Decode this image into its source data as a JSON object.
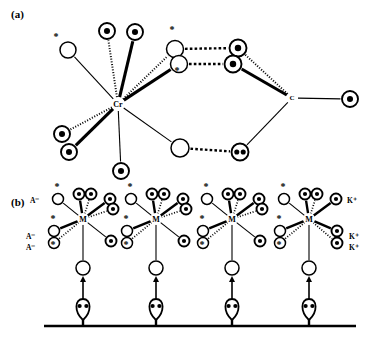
{
  "figure": {
    "panels": [
      {
        "id": "a",
        "label": "(a)",
        "label_x": 11,
        "label_y": 8
      },
      {
        "id": "b",
        "label": "(b)",
        "label_x": 11,
        "label_y": 196
      }
    ]
  },
  "panel_a": {
    "center_atom": {
      "label": "Cr",
      "x": 118,
      "y": 104,
      "font_size": 8
    },
    "bridge_atom": {
      "label": "C",
      "x": 292,
      "y": 98,
      "font_size": 7
    },
    "nodes": [
      {
        "name": "open-star-upper-left",
        "x": 68,
        "y": 50,
        "r": 8,
        "type": "open",
        "star": true,
        "star_dx": -12,
        "star_dy": -10
      },
      {
        "name": "dot-top-left",
        "x": 107,
        "y": 31,
        "r": 8,
        "type": "dot"
      },
      {
        "name": "dot-top-right",
        "x": 135,
        "y": 32,
        "r": 8,
        "type": "dot"
      },
      {
        "name": "dot-lower-left-upper",
        "x": 62,
        "y": 134,
        "r": 8,
        "type": "dot"
      },
      {
        "name": "dot-lower-left-lower",
        "x": 69,
        "y": 152,
        "r": 8,
        "type": "dot"
      },
      {
        "name": "dot-bottom-center",
        "x": 121,
        "y": 171,
        "r": 8,
        "type": "dot"
      },
      {
        "name": "open-bridge-upper",
        "x": 175,
        "y": 49,
        "r": 8.5,
        "type": "open",
        "star": true,
        "star_dx": -3,
        "star_dy": -16
      },
      {
        "name": "open-bridge-lower",
        "x": 179,
        "y": 64,
        "r": 8.5,
        "type": "open",
        "star": true,
        "star_dx": -2,
        "star_dy": 10
      },
      {
        "name": "dot-ring-upper-right",
        "x": 238,
        "y": 48,
        "r": 8.5,
        "type": "dot"
      },
      {
        "name": "dot-ring-lower-right",
        "x": 233,
        "y": 64,
        "r": 8.5,
        "type": "dot"
      },
      {
        "name": "open-bottom-middle",
        "x": 180,
        "y": 148,
        "r": 9,
        "type": "open"
      },
      {
        "name": "double-dot-bottom-right",
        "x": 240,
        "y": 152,
        "r": 8.5,
        "type": "doubledot"
      },
      {
        "name": "dot-far-right",
        "x": 350,
        "y": 99,
        "r": 8,
        "type": "dot"
      }
    ],
    "bonds": [
      {
        "from": [
          118,
          104
        ],
        "to": [
          68,
          50
        ],
        "style": "thin"
      },
      {
        "from": [
          118,
          104
        ],
        "to": [
          107,
          31
        ],
        "style": "dotted"
      },
      {
        "from": [
          118,
          104
        ],
        "to": [
          135,
          32
        ],
        "style": "bold"
      },
      {
        "from": [
          118,
          104
        ],
        "to": [
          62,
          134
        ],
        "style": "dotted"
      },
      {
        "from": [
          118,
          104
        ],
        "to": [
          69,
          152
        ],
        "style": "bold"
      },
      {
        "from": [
          118,
          104
        ],
        "to": [
          121,
          171
        ],
        "style": "thin"
      },
      {
        "from": [
          118,
          104
        ],
        "to": [
          175,
          49
        ],
        "style": "dotted"
      },
      {
        "from": [
          118,
          104
        ],
        "to": [
          179,
          64
        ],
        "style": "bold"
      },
      {
        "from": [
          118,
          104
        ],
        "to": [
          180,
          148
        ],
        "style": "thin"
      },
      {
        "from": [
          175,
          49
        ],
        "to": [
          238,
          48
        ],
        "style": "dashed-h"
      },
      {
        "from": [
          179,
          64
        ],
        "to": [
          233,
          64
        ],
        "style": "dashed-h"
      },
      {
        "from": [
          180,
          148
        ],
        "to": [
          240,
          152
        ],
        "style": "dashed-h"
      },
      {
        "from": [
          238,
          48
        ],
        "to": [
          292,
          98
        ],
        "style": "dotted"
      },
      {
        "from": [
          233,
          64
        ],
        "to": [
          292,
          98
        ],
        "style": "bold"
      },
      {
        "from": [
          240,
          152
        ],
        "to": [
          292,
          98
        ],
        "style": "thin"
      },
      {
        "from": [
          292,
          98
        ],
        "to": [
          350,
          99
        ],
        "style": "thin"
      }
    ]
  },
  "panel_b": {
    "baseline": {
      "x1": 44,
      "x2": 356,
      "y": 326
    },
    "clusters": [
      {
        "name": "cluster-1",
        "center": {
          "label": "M",
          "x": 83,
          "y": 219,
          "font_size": 8
        },
        "anchor": {
          "x": 83,
          "y": 268,
          "r": 7
        },
        "head": {
          "x": 83,
          "y": 310
        },
        "arrow": {
          "x": 83,
          "y_from": 300,
          "y_to": 277
        },
        "ions": [
          {
            "text": "A⁻",
            "x": 30,
            "y": 196
          },
          {
            "text": "A⁻",
            "x": 26,
            "y": 232
          },
          {
            "text": "A⁻",
            "x": 26,
            "y": 243
          }
        ],
        "nodes": [
          {
            "name": "open-star-upper-left",
            "x": 58,
            "y": 199,
            "r": 5.5,
            "type": "open",
            "star": true,
            "star_dx": -1,
            "star_dy": -9,
            "bond": "thin"
          },
          {
            "name": "dot-top-a",
            "x": 79,
            "y": 194,
            "r": 5.5,
            "type": "dot",
            "bond": "bold"
          },
          {
            "name": "dot-top-b",
            "x": 91,
            "y": 194,
            "r": 5.5,
            "type": "dot",
            "bond": "dotted"
          },
          {
            "name": "dot-upper-right-a",
            "x": 110,
            "y": 199,
            "r": 5.5,
            "type": "dot",
            "bond": "bold"
          },
          {
            "name": "dot-upper-right-b",
            "x": 113,
            "y": 209,
            "r": 5.5,
            "type": "dot",
            "bond": "dotted"
          },
          {
            "name": "open-star-left-a",
            "x": 54,
            "y": 231,
            "r": 5.5,
            "type": "open",
            "star": true,
            "star_dx": -1,
            "star_dy": -9,
            "bond": "bold"
          },
          {
            "name": "open-star-left-b",
            "x": 54,
            "y": 243,
            "r": 5.5,
            "type": "open",
            "star": true,
            "star_dx": -1,
            "star_dy": 5,
            "bond": "dotted"
          },
          {
            "name": "dot-lower-right",
            "x": 111,
            "y": 241,
            "r": 5.5,
            "type": "dot",
            "bond": "thin"
          }
        ]
      },
      {
        "name": "cluster-2",
        "center": {
          "label": "M",
          "x": 156,
          "y": 219,
          "font_size": 8
        },
        "anchor": {
          "x": 156,
          "y": 268,
          "r": 7
        },
        "head": {
          "x": 156,
          "y": 310
        },
        "arrow": {
          "x": 156,
          "y_from": 300,
          "y_to": 277
        },
        "ions": [],
        "nodes": [
          {
            "name": "open-star-upper-left",
            "x": 131,
            "y": 199,
            "r": 5.5,
            "type": "open",
            "star": true,
            "star_dx": -1,
            "star_dy": -9,
            "bond": "thin"
          },
          {
            "name": "dot-top-a",
            "x": 152,
            "y": 194,
            "r": 5.5,
            "type": "dot",
            "bond": "bold"
          },
          {
            "name": "dot-top-b",
            "x": 164,
            "y": 194,
            "r": 5.5,
            "type": "dot",
            "bond": "dotted"
          },
          {
            "name": "dot-upper-right-a",
            "x": 183,
            "y": 199,
            "r": 5.5,
            "type": "dot",
            "bond": "bold"
          },
          {
            "name": "dot-upper-right-b",
            "x": 186,
            "y": 209,
            "r": 5.5,
            "type": "dot",
            "bond": "dotted"
          },
          {
            "name": "open-star-left-a",
            "x": 127,
            "y": 231,
            "r": 5.5,
            "type": "open",
            "star": true,
            "star_dx": -1,
            "star_dy": -9,
            "bond": "bold"
          },
          {
            "name": "open-star-left-b",
            "x": 127,
            "y": 243,
            "r": 5.5,
            "type": "open",
            "star": true,
            "star_dx": -1,
            "star_dy": 5,
            "bond": "dotted"
          },
          {
            "name": "dot-lower-right",
            "x": 184,
            "y": 241,
            "r": 5.5,
            "type": "dot",
            "bond": "thin"
          }
        ]
      },
      {
        "name": "cluster-3",
        "center": {
          "label": "M",
          "x": 232,
          "y": 219,
          "font_size": 8
        },
        "anchor": {
          "x": 232,
          "y": 268,
          "r": 7
        },
        "head": {
          "x": 232,
          "y": 310
        },
        "arrow": {
          "x": 232,
          "y_from": 300,
          "y_to": 277
        },
        "ions": [],
        "nodes": [
          {
            "name": "open-star-upper-left",
            "x": 207,
            "y": 199,
            "r": 5.5,
            "type": "open",
            "star": true,
            "star_dx": -1,
            "star_dy": -9,
            "bond": "thin"
          },
          {
            "name": "dot-top-a",
            "x": 228,
            "y": 194,
            "r": 5.5,
            "type": "dot",
            "bond": "bold"
          },
          {
            "name": "dot-top-b",
            "x": 240,
            "y": 194,
            "r": 5.5,
            "type": "dot",
            "bond": "dotted"
          },
          {
            "name": "dot-upper-right-a",
            "x": 259,
            "y": 199,
            "r": 5.5,
            "type": "dot",
            "bond": "bold"
          },
          {
            "name": "dot-upper-right-b",
            "x": 262,
            "y": 209,
            "r": 5.5,
            "type": "dot",
            "bond": "dotted"
          },
          {
            "name": "open-star-left-a",
            "x": 203,
            "y": 231,
            "r": 5.5,
            "type": "open",
            "star": true,
            "star_dx": -1,
            "star_dy": -9,
            "bond": "bold"
          },
          {
            "name": "open-star-left-b",
            "x": 203,
            "y": 243,
            "r": 5.5,
            "type": "open",
            "star": true,
            "star_dx": -1,
            "star_dy": 5,
            "bond": "dotted"
          },
          {
            "name": "dot-lower-right",
            "x": 260,
            "y": 241,
            "r": 5.5,
            "type": "dot",
            "bond": "thin"
          }
        ]
      },
      {
        "name": "cluster-4",
        "center": {
          "label": "M",
          "x": 309,
          "y": 219,
          "font_size": 8
        },
        "anchor": {
          "x": 309,
          "y": 268,
          "r": 7
        },
        "head": {
          "x": 309,
          "y": 310
        },
        "arrow": {
          "x": 309,
          "y_from": 300,
          "y_to": 277
        },
        "ions": [
          {
            "text": "K⁺",
            "x": 347,
            "y": 196
          },
          {
            "text": "K⁺",
            "x": 349,
            "y": 232
          },
          {
            "text": "K⁺",
            "x": 349,
            "y": 243
          }
        ],
        "nodes": [
          {
            "name": "open-star-upper-left",
            "x": 284,
            "y": 199,
            "r": 5.5,
            "type": "open",
            "star": true,
            "star_dx": -1,
            "star_dy": -9,
            "bond": "thin"
          },
          {
            "name": "dot-top-a",
            "x": 305,
            "y": 194,
            "r": 5.5,
            "type": "dot",
            "bond": "bold"
          },
          {
            "name": "dot-top-b",
            "x": 317,
            "y": 194,
            "r": 5.5,
            "type": "dot",
            "bond": "dotted"
          },
          {
            "name": "dot-upper-right",
            "x": 336,
            "y": 199,
            "r": 5.5,
            "type": "dot",
            "bond": "bold"
          },
          {
            "name": "open-star-left-a",
            "x": 280,
            "y": 231,
            "r": 5.5,
            "type": "open",
            "star": true,
            "star_dx": -1,
            "star_dy": -9,
            "bond": "bold"
          },
          {
            "name": "open-star-left-b",
            "x": 280,
            "y": 243,
            "r": 5.5,
            "type": "open",
            "star": true,
            "star_dx": -1,
            "star_dy": 5,
            "bond": "dotted"
          },
          {
            "name": "dot-lower-right-a",
            "x": 337,
            "y": 231,
            "r": 5.5,
            "type": "dot",
            "bond": "bold"
          },
          {
            "name": "dot-lower-right-b",
            "x": 337,
            "y": 243,
            "r": 5.5,
            "type": "dot",
            "bond": "dotted"
          }
        ]
      }
    ]
  },
  "colors": {
    "ink": "#000000",
    "background": "#ffffff"
  }
}
